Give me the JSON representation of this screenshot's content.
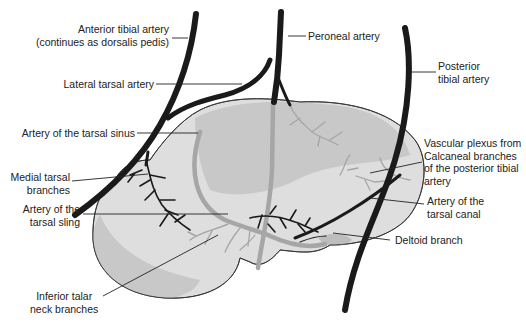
{
  "diagram": {
    "labels": {
      "anterior_tibial": [
        "Anterior tibial artery",
        "(continues as dorsalis pedis)"
      ],
      "peroneal": [
        "Peroneal artery"
      ],
      "posterior_tibial": [
        "Posterior",
        "tibial artery"
      ],
      "lateral_tarsal": [
        "Lateral tarsal artery"
      ],
      "tarsal_sinus": [
        "Artery of the tarsal sinus"
      ],
      "medial_tarsal": [
        "Medial tarsal",
        "branches"
      ],
      "tarsal_sling": [
        "Artery of the",
        "tarsal sling"
      ],
      "vascular_plexus": [
        "Vascular plexus from",
        "Calcaneal branches",
        "of the posterior tibial",
        "artery"
      ],
      "tarsal_canal": [
        "Artery of the",
        "tarsal canal"
      ],
      "deltoid": [
        "Deltoid branch"
      ],
      "inferior_talar": [
        "Inferior talar",
        "neck branches"
      ]
    },
    "colors": {
      "artery": "#1a1a1a",
      "bone_light": "#dcdcdc",
      "bone_mid": "#c4c4c4",
      "vessel_gray": "#a8a8a8",
      "leader": "#222222"
    }
  }
}
